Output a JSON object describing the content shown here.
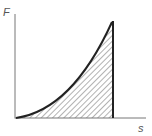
{
  "diagram": {
    "y_axis_label": "F",
    "x_axis_label": "s",
    "colors": {
      "axis": "#777777",
      "curve": "#222222",
      "hatch": "#666666",
      "background": "#ffffff"
    }
  }
}
